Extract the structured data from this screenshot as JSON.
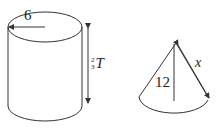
{
  "figure": {
    "cylinder": {
      "radius_label": "6",
      "height_label": {
        "numerator": "2",
        "denominator": "3",
        "variable": "T"
      }
    },
    "cone": {
      "height_label": "12",
      "slant_label": "x"
    }
  },
  "colors": {
    "stroke": "#333333",
    "background": "#ffffff"
  }
}
